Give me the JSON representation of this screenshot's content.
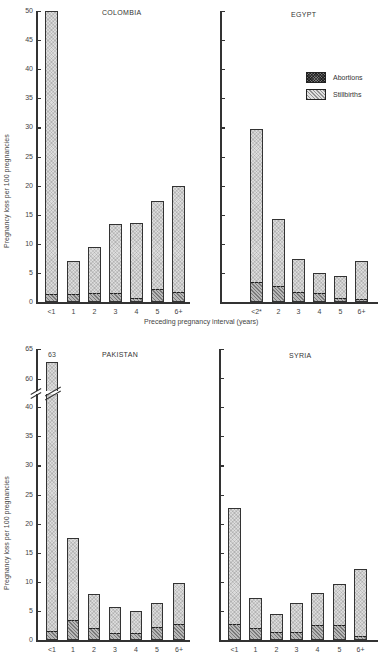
{
  "figure": {
    "yaxis_title": "Pregnancy loss per 100 pregnancies",
    "xaxis_title": "Preceding pregnancy interval (years)",
    "legend": [
      {
        "key": "abortions",
        "label": "Abortions"
      },
      {
        "key": "stillbirths",
        "label": "Stillbirths"
      }
    ]
  },
  "chart_data": [
    {
      "type": "bar",
      "stacked": true,
      "title": "COLOMBIA",
      "categories": [
        "<1",
        "1",
        "2",
        "3",
        "4",
        "5",
        "6+"
      ],
      "series": [
        {
          "name": "Abortions",
          "values": [
            1.2,
            1.2,
            1.4,
            1.3,
            0.6,
            2.0,
            1.6
          ]
        },
        {
          "name": "Stillbirths",
          "values": [
            48.8,
            5.8,
            8.1,
            12.1,
            13.0,
            15.4,
            18.4
          ]
        }
      ],
      "totals": [
        50,
        7.0,
        9.5,
        13.4,
        13.6,
        17.4,
        20.0
      ],
      "xlabel": "Preceding pregnancy interval (years)",
      "ylabel": "Pregnancy loss per 100 pregnancies",
      "ylim": [
        0,
        50
      ],
      "yticks": [
        0,
        5,
        10,
        15,
        20,
        25,
        30,
        35,
        40,
        45,
        50
      ],
      "grid": false
    },
    {
      "type": "bar",
      "stacked": true,
      "title": "EGYPT",
      "categories": [
        "<2*",
        "2",
        "3",
        "4",
        "5",
        "6+"
      ],
      "series": [
        {
          "name": "Abortions",
          "values": [
            3.2,
            2.5,
            1.6,
            1.4,
            0.6,
            0.4
          ]
        },
        {
          "name": "Stillbirths",
          "values": [
            26.6,
            11.8,
            5.8,
            3.5,
            3.9,
            6.7
          ]
        }
      ],
      "totals": [
        29.8,
        14.3,
        7.4,
        4.9,
        4.5,
        7.1
      ],
      "xlabel": "Preceding pregnancy interval (years)",
      "ylabel": "",
      "ylim": [
        0,
        50
      ],
      "yticks": [
        0,
        5,
        10,
        15,
        20,
        25,
        30,
        35,
        40,
        45,
        50
      ],
      "legend_position": "upper right",
      "grid": false
    },
    {
      "type": "bar",
      "stacked": true,
      "title": "PAKISTAN",
      "categories": [
        "<1",
        "1",
        "2",
        "3",
        "4",
        "5",
        "6+"
      ],
      "series": [
        {
          "name": "Abortions",
          "values": [
            1.4,
            3.2,
            1.9,
            1.1,
            1.0,
            2.0,
            2.6
          ]
        },
        {
          "name": "Stillbirths",
          "values": [
            61.6,
            14.4,
            6.0,
            4.5,
            3.9,
            4.4,
            7.2
          ]
        }
      ],
      "totals": [
        63,
        17.6,
        7.9,
        5.6,
        4.9,
        6.4,
        9.8
      ],
      "annotations": [
        {
          "category": "<1",
          "text": "63"
        }
      ],
      "axis_break": [
        40,
        60
      ],
      "xlabel": "",
      "ylabel": "Pregnancy loss per 100 pregnancies",
      "ylim": [
        0,
        65
      ],
      "yticks": [
        0,
        5,
        10,
        15,
        20,
        25,
        30,
        35,
        40,
        60,
        65
      ],
      "grid": false
    },
    {
      "type": "bar",
      "stacked": true,
      "title": "SYRIA",
      "categories": [
        "<1",
        "1",
        "2",
        "3",
        "4",
        "5",
        "6+"
      ],
      "series": [
        {
          "name": "Abortions",
          "values": [
            2.5,
            1.9,
            1.2,
            1.2,
            2.4,
            2.4,
            0.5
          ]
        },
        {
          "name": "Stillbirths",
          "values": [
            20.2,
            5.3,
            3.3,
            5.1,
            5.6,
            7.3,
            11.7
          ]
        }
      ],
      "totals": [
        22.7,
        7.2,
        4.5,
        6.3,
        8.0,
        9.7,
        12.2
      ],
      "xlabel": "",
      "ylabel": "",
      "ylim": [
        0,
        65
      ],
      "grid": false
    }
  ],
  "panels": [
    {
      "title": "COLOMBIA",
      "axis_x": 36,
      "base_y": 302,
      "top_y": 11,
      "title_x": 102,
      "title_y": 9,
      "axis_right": 190,
      "px_per_unit": 5.82,
      "show_tick_labels": true,
      "bar_lefts": [
        45,
        67,
        88,
        109,
        130,
        151,
        172
      ],
      "bar_width": 13,
      "tick_values": [
        0,
        5,
        10,
        15,
        20,
        25,
        30,
        35,
        40,
        45,
        50
      ]
    },
    {
      "title": "EGYPT",
      "axis_x": 220,
      "base_y": 302,
      "top_y": 11,
      "title_x": 291,
      "title_y": 11,
      "axis_right": 378,
      "px_per_unit": 5.82,
      "show_tick_labels": false,
      "bar_lefts": [
        250,
        272,
        292,
        313,
        334,
        355
      ],
      "bar_width": 13,
      "tick_values": [
        0,
        5,
        10,
        15,
        20,
        25,
        30,
        35,
        40,
        45,
        50
      ]
    },
    {
      "title": "PAKISTAN",
      "axis_x": 36,
      "base_y": 640,
      "top_y": 349,
      "title_x": 102,
      "title_y": 351,
      "axis_right": 190,
      "px_per_unit": 5.82,
      "show_tick_labels": true,
      "bar_lefts": [
        46,
        67,
        88,
        109,
        130,
        151,
        173
      ],
      "bar_width": 12,
      "tick_values": [
        0,
        5,
        10,
        15,
        20,
        25,
        30,
        35,
        40
      ],
      "upper_ticks": [
        {
          "v": 60,
          "y": 379
        },
        {
          "v": 65,
          "y": 349
        }
      ],
      "break_y": 393,
      "cap_value_y": 353
    },
    {
      "title": "SYRIA",
      "axis_x": 219,
      "base_y": 640,
      "top_y": 349,
      "title_x": 289,
      "title_y": 352,
      "axis_right": 378,
      "px_per_unit": 5.82,
      "show_tick_labels": false,
      "bar_lefts": [
        228,
        249,
        270,
        290,
        311,
        333,
        354
      ],
      "bar_width": 13,
      "tick_values": [
        0,
        5,
        10,
        15,
        20,
        25,
        30,
        35,
        40,
        45,
        50
      ]
    }
  ],
  "caption": "Fig. ..."
}
